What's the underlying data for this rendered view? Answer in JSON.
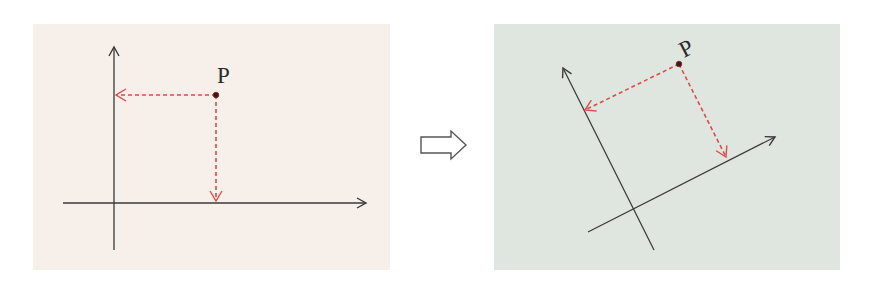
{
  "diagram": {
    "colors": {
      "left_panel_bg": "#f7efea",
      "right_panel_bg": "#dfe6df",
      "axis": "#3a3a3a",
      "projection": "#e04a4a",
      "point": "#3a1a1a",
      "transition_arrow": "#555555"
    },
    "left_panel": {
      "point_label": "P",
      "axes": "standard (horizontal x, vertical y)"
    },
    "transition_icon": "hollow-right-arrow-icon",
    "right_panel": {
      "point_label": "P",
      "axes": "rotated (~27° counter-clockwise)"
    }
  }
}
